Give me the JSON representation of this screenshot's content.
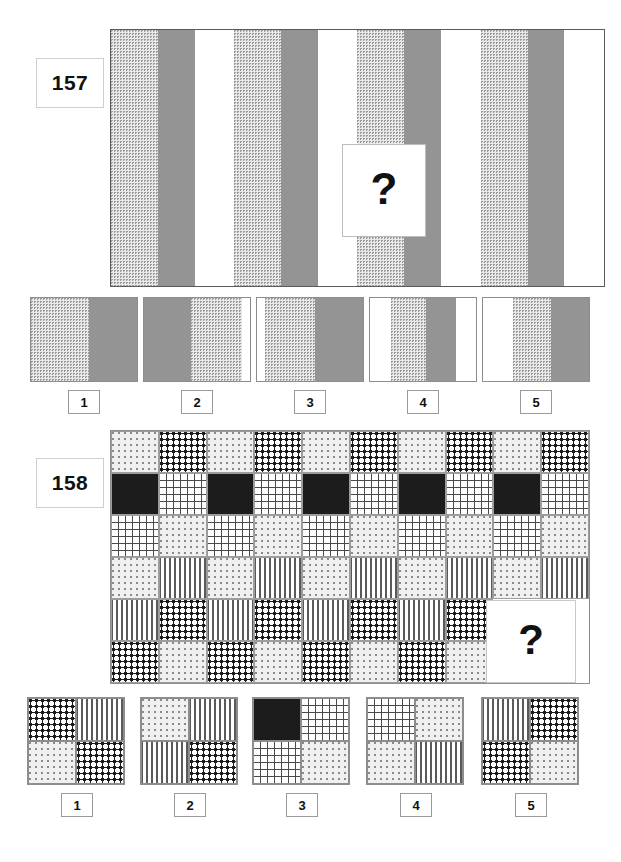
{
  "page": {
    "kind": "visual-reasoning-test",
    "question_mark": "?"
  },
  "palette": {
    "white": "#ffffff",
    "gray": "#949494",
    "black": "#1c1c1c",
    "dot_light": "#f0f0f0",
    "screen": "#e9e9e9",
    "border": "#8d8d8d"
  },
  "puzzle157": {
    "number": "157",
    "prompt_icon": "question-mark-icon",
    "sequence": {
      "type": "vertical-stripe-series",
      "repeat_unit": [
        "screen",
        "gray",
        "white"
      ],
      "stripes": [
        {
          "fill": "screen",
          "width": 10.3
        },
        {
          "fill": "gray",
          "width": 8.1
        },
        {
          "fill": "white",
          "width": 8.7
        },
        {
          "fill": "screen",
          "width": 10.3
        },
        {
          "fill": "gray",
          "width": 8.1
        },
        {
          "fill": "white",
          "width": 8.7
        },
        {
          "fill": "screen",
          "width": 10.3
        },
        {
          "fill": "gray",
          "width": 8.1
        },
        {
          "fill": "white",
          "width": 8.7
        },
        {
          "fill": "screen",
          "width": 10.3
        },
        {
          "fill": "gray",
          "width": 8.1
        },
        {
          "fill": "white",
          "width": 8.7
        }
      ]
    },
    "options": [
      {
        "label": "1",
        "segments": [
          {
            "fill": "screen",
            "width": 55
          },
          {
            "fill": "gray",
            "width": 45
          }
        ]
      },
      {
        "label": "2",
        "segments": [
          {
            "fill": "gray",
            "width": 44
          },
          {
            "fill": "screen",
            "width": 48
          },
          {
            "fill": "white",
            "width": 8
          }
        ]
      },
      {
        "label": "3",
        "segments": [
          {
            "fill": "white",
            "width": 8
          },
          {
            "fill": "screen",
            "width": 47
          },
          {
            "fill": "gray",
            "width": 45
          }
        ]
      },
      {
        "label": "4",
        "segments": [
          {
            "fill": "white",
            "width": 20
          },
          {
            "fill": "screen",
            "width": 33
          },
          {
            "fill": "gray",
            "width": 28
          },
          {
            "fill": "white",
            "width": 19
          }
        ]
      },
      {
        "label": "5",
        "segments": [
          {
            "fill": "white",
            "width": 28
          },
          {
            "fill": "screen",
            "width": 36
          },
          {
            "fill": "gray",
            "width": 36
          }
        ]
      }
    ]
  },
  "puzzle158": {
    "number": "158",
    "prompt_icon": "question-mark-icon",
    "grid": {
      "columns": 10,
      "rows": 6,
      "row_patterns": [
        [
          "lightdot",
          "bolddot",
          "lightdot",
          "bolddot",
          "lightdot",
          "bolddot",
          "lightdot",
          "bolddot",
          "lightdot",
          "bolddot"
        ],
        [
          "black",
          "grid",
          "black",
          "grid",
          "black",
          "grid",
          "black",
          "grid",
          "black",
          "grid"
        ],
        [
          "grid",
          "lightdot",
          "grid",
          "lightdot",
          "grid",
          "lightdot",
          "grid",
          "lightdot",
          "grid",
          "lightdot"
        ],
        [
          "lightdot",
          "vert",
          "lightdot",
          "vert",
          "lightdot",
          "vert",
          "lightdot",
          "vert",
          "lightdot",
          "vert"
        ],
        [
          "vert",
          "bolddot",
          "vert",
          "bolddot",
          "vert",
          "bolddot",
          "vert",
          "bolddot",
          "hidden",
          "hidden"
        ],
        [
          "bolddot",
          "lightdot",
          "bolddot",
          "lightdot",
          "bolddot",
          "lightdot",
          "bolddot",
          "lightdot",
          "hidden",
          "hidden"
        ]
      ]
    },
    "options": [
      {
        "label": "1",
        "quadrants": [
          "bolddot",
          "vert",
          "lightdot",
          "bolddot"
        ]
      },
      {
        "label": "2",
        "quadrants": [
          "lightdot",
          "vert",
          "vert",
          "bolddot"
        ]
      },
      {
        "label": "3",
        "quadrants": [
          "black",
          "grid",
          "grid",
          "lightdot"
        ]
      },
      {
        "label": "4",
        "quadrants": [
          "grid",
          "lightdot",
          "lightdot",
          "vert"
        ]
      },
      {
        "label": "5",
        "quadrants": [
          "vert",
          "bolddot",
          "bolddot",
          "lightdot"
        ]
      }
    ]
  }
}
